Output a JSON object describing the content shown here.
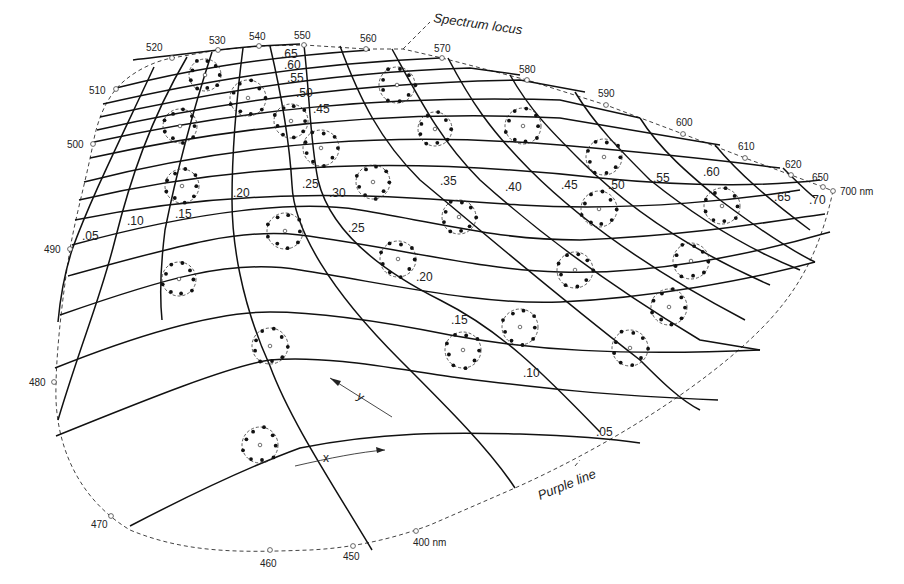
{
  "diagram": {
    "annotations": {
      "spectrum_locus": "Spectrum locus",
      "purple_line": "Purple line",
      "x_axis_arrow": "x",
      "y_axis_arrow": "y"
    },
    "wavelength_labels": [
      {
        "label": "520",
        "x": 146,
        "y": 51,
        "mx": 172,
        "my": 58
      },
      {
        "label": "530",
        "x": 209,
        "y": 44,
        "mx": 218,
        "my": 50
      },
      {
        "label": "540",
        "x": 249,
        "y": 40,
        "mx": 259,
        "my": 46
      },
      {
        "label": "550",
        "x": 294,
        "y": 39,
        "mx": 304,
        "my": 45
      },
      {
        "label": "560",
        "x": 360,
        "y": 42,
        "mx": 366,
        "my": 49
      },
      {
        "label": "570",
        "x": 434,
        "y": 52,
        "mx": 442,
        "my": 58
      },
      {
        "label": "580",
        "x": 519,
        "y": 73,
        "mx": 527,
        "my": 80
      },
      {
        "label": "590",
        "x": 598,
        "y": 97,
        "mx": 606,
        "my": 105
      },
      {
        "label": "600",
        "x": 676,
        "y": 126,
        "mx": 683,
        "my": 134
      },
      {
        "label": "610",
        "x": 738,
        "y": 150,
        "mx": 745,
        "my": 158
      },
      {
        "label": "620",
        "x": 785,
        "y": 168,
        "mx": 791,
        "my": 175
      },
      {
        "label": "650",
        "x": 812,
        "y": 181,
        "mx": 823,
        "my": 187
      },
      {
        "label": "700 nm",
        "x": 840,
        "y": 195,
        "mx": 833,
        "my": 191
      },
      {
        "label": "510",
        "x": 89,
        "y": 94,
        "mx": 116,
        "my": 89
      },
      {
        "label": "500",
        "x": 67,
        "y": 148,
        "mx": 93,
        "my": 144
      },
      {
        "label": "490",
        "x": 44,
        "y": 253,
        "mx": 70,
        "my": 249
      },
      {
        "label": "480",
        "x": 29,
        "y": 386,
        "mx": 54,
        "my": 382
      },
      {
        "label": "470",
        "x": 91,
        "y": 528,
        "mx": 111,
        "my": 516
      },
      {
        "label": "460",
        "x": 260,
        "y": 567,
        "mx": 270,
        "my": 550
      },
      {
        "label": "450",
        "x": 343,
        "y": 560,
        "mx": 353,
        "my": 546
      },
      {
        "label": "400 nm",
        "x": 413,
        "y": 546,
        "mx": 416,
        "my": 531
      }
    ],
    "x_coordinate_labels": [
      {
        "label": ".05",
        "x": 82,
        "y": 240
      },
      {
        "label": ".10",
        "x": 127,
        "y": 225
      },
      {
        "label": ".15",
        "x": 175,
        "y": 218
      },
      {
        "label": ".20",
        "x": 233,
        "y": 197
      },
      {
        "label": ".25",
        "x": 302,
        "y": 188
      },
      {
        "label": ".30",
        "x": 329,
        "y": 197
      },
      {
        "label": ".35",
        "x": 440,
        "y": 185
      },
      {
        "label": ".40",
        "x": 505,
        "y": 191
      },
      {
        "label": ".45",
        "x": 561,
        "y": 189
      },
      {
        "label": ".50",
        "x": 608,
        "y": 189
      },
      {
        "label": ".55",
        "x": 653,
        "y": 182
      },
      {
        "label": ".60",
        "x": 703,
        "y": 176
      },
      {
        "label": ".65",
        "x": 774,
        "y": 201
      },
      {
        "label": ".70",
        "x": 809,
        "y": 204
      }
    ],
    "y_coordinate_labels": [
      {
        "label": ".65",
        "x": 281,
        "y": 58
      },
      {
        "label": ".60",
        "x": 284,
        "y": 69
      },
      {
        "label": ".55",
        "x": 287,
        "y": 82
      },
      {
        "label": ".50",
        "x": 296,
        "y": 97
      },
      {
        "label": ".45",
        "x": 313,
        "y": 113
      },
      {
        "label": ".25",
        "x": 348,
        "y": 232
      },
      {
        "label": ".20",
        "x": 416,
        "y": 281
      },
      {
        "label": ".15",
        "x": 451,
        "y": 324
      },
      {
        "label": ".10",
        "x": 523,
        "y": 377
      },
      {
        "label": ".05",
        "x": 596,
        "y": 436
      }
    ],
    "ellipses": [
      {
        "cx": 205,
        "cy": 75,
        "r": 16
      },
      {
        "cx": 248,
        "cy": 98,
        "r": 18
      },
      {
        "cx": 180,
        "cy": 126,
        "r": 17
      },
      {
        "cx": 291,
        "cy": 121,
        "r": 17
      },
      {
        "cx": 321,
        "cy": 148,
        "r": 18
      },
      {
        "cx": 397,
        "cy": 85,
        "r": 18
      },
      {
        "cx": 435,
        "cy": 129,
        "r": 17
      },
      {
        "cx": 523,
        "cy": 126,
        "r": 18
      },
      {
        "cx": 182,
        "cy": 186,
        "r": 17
      },
      {
        "cx": 373,
        "cy": 182,
        "r": 17
      },
      {
        "cx": 604,
        "cy": 157,
        "r": 18
      },
      {
        "cx": 459,
        "cy": 217,
        "r": 17
      },
      {
        "cx": 599,
        "cy": 209,
        "r": 18
      },
      {
        "cx": 722,
        "cy": 206,
        "r": 18
      },
      {
        "cx": 285,
        "cy": 231,
        "r": 18
      },
      {
        "cx": 398,
        "cy": 259,
        "r": 18
      },
      {
        "cx": 575,
        "cy": 270,
        "r": 18
      },
      {
        "cx": 691,
        "cy": 261,
        "r": 18
      },
      {
        "cx": 179,
        "cy": 279,
        "r": 17
      },
      {
        "cx": 669,
        "cy": 307,
        "r": 18
      },
      {
        "cx": 520,
        "cy": 327,
        "r": 18
      },
      {
        "cx": 463,
        "cy": 350,
        "r": 18
      },
      {
        "cx": 630,
        "cy": 348,
        "r": 18
      },
      {
        "cx": 270,
        "cy": 346,
        "r": 18
      },
      {
        "cx": 260,
        "cy": 445,
        "r": 18
      }
    ]
  }
}
